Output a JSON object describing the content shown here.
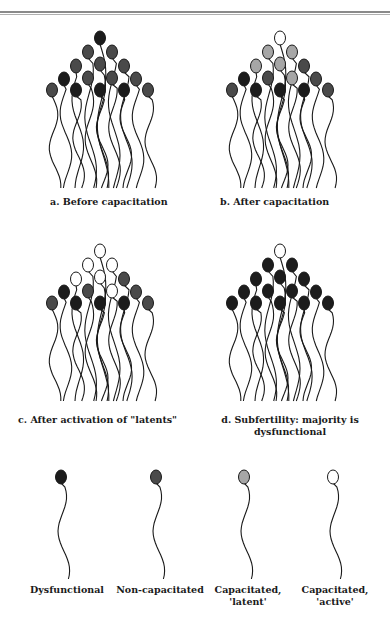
{
  "colors": {
    "dysfunctional": "#1c1c1c",
    "non_capacitated": "#4a4a4a",
    "latent": "#a6a6a6",
    "active": "#ffffff",
    "stroke": "#1a1a1a"
  },
  "panels": [
    {
      "id": "a",
      "label": "a. Before capacitation",
      "origin": [
        45,
        32
      ],
      "heads": [
        "dys",
        "nc",
        "nc",
        "nc",
        "nc",
        "nc",
        "dys",
        "nc",
        "nc",
        "nc",
        "nc",
        "dys",
        "dys",
        "dys",
        "nc",
        "nc",
        "dys"
      ]
    },
    {
      "id": "b",
      "label": "b.  After capacitation",
      "origin": [
        225,
        32
      ],
      "heads": [
        "act",
        "lat",
        "lat",
        "lat",
        "lat",
        "nc",
        "dys",
        "nc",
        "lat",
        "nc",
        "nc",
        "dys",
        "dys",
        "dys",
        "nc",
        "nc",
        "dys"
      ]
    },
    {
      "id": "c",
      "label": "c.  After activation of \"latents\"",
      "origin": [
        45,
        245
      ],
      "heads": [
        "act",
        "act",
        "act",
        "act",
        "act",
        "nc",
        "dys",
        "nc",
        "act",
        "nc",
        "nc",
        "dys",
        "dys",
        "dys",
        "nc",
        "nc",
        "dys"
      ]
    },
    {
      "id": "d",
      "label_line1": "d. Subfertility: majority is",
      "label_line2": "dysfunctional",
      "origin": [
        225,
        245
      ],
      "heads": [
        "act",
        "dys",
        "dys",
        "dys",
        "dys",
        "dys",
        "dys",
        "dys",
        "dys",
        "dys",
        "dys",
        "dys",
        "dys",
        "dys",
        "dys",
        "dys",
        "dys"
      ]
    }
  ],
  "legend": [
    {
      "type": "dys",
      "label_line1": "Dysfunctional",
      "label_line2": ""
    },
    {
      "type": "nc",
      "label_line1": "Non-capacitated",
      "label_line2": ""
    },
    {
      "type": "lat",
      "label_line1": "Capacitated,",
      "label_line2": "'latent'"
    },
    {
      "type": "act",
      "label_line1": "Capacitated,",
      "label_line2": "'active'"
    }
  ]
}
